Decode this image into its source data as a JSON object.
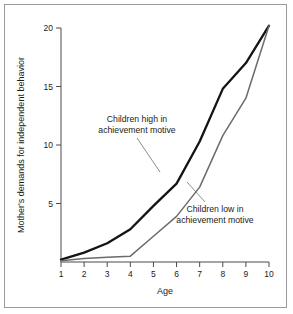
{
  "chart_data": {
    "type": "line",
    "title": "",
    "subtitle": "",
    "xlabel": "Age",
    "ylabel": "Mother's demands for independent behavior",
    "x": [
      1,
      2,
      3,
      4,
      5,
      6,
      7,
      8,
      9,
      10
    ],
    "xtick_labels": [
      "1",
      "2",
      "3",
      "4",
      "5",
      "6",
      "7",
      "8",
      "9",
      "10"
    ],
    "ytick_labels": [
      "5",
      "10",
      "15",
      "20"
    ],
    "yticks": [
      5,
      10,
      15,
      20
    ],
    "xlim": [
      1,
      10
    ],
    "ylim": [
      0,
      20.5
    ],
    "grid": false,
    "legend_position": "inline-annotations",
    "series": [
      {
        "name": "Children high in achievement motive",
        "color": "#141414",
        "line_width": "thick",
        "values": [
          0.2,
          0.8,
          1.6,
          2.8,
          4.8,
          6.7,
          10.3,
          14.8,
          17.0,
          20.2
        ]
      },
      {
        "name": "Children low in achievement motive",
        "color": "#6b6b6b",
        "line_width": "thin",
        "values": [
          0.1,
          0.3,
          0.4,
          0.5,
          2.2,
          3.9,
          6.4,
          10.8,
          14.0,
          20.2
        ]
      }
    ],
    "annotations": [
      {
        "id": "annotation-high",
        "lines": [
          "Children high in",
          "achievement motive"
        ],
        "text_x": 137,
        "text_y": 122,
        "anchor": "middle",
        "leader_from_x": 137,
        "leader_from_y": 138,
        "leader_to_x": 160,
        "leader_to_y": 172
      },
      {
        "id": "annotation-low",
        "lines": [
          "Children low in",
          "achievement motive"
        ],
        "text_x": 215,
        "text_y": 212,
        "anchor": "middle",
        "leader_from_x": 205,
        "leader_from_y": 202,
        "leader_to_x": 187,
        "leader_to_y": 182
      }
    ],
    "axes_geometry": {
      "x_pixel_at_age_1": 61,
      "x_pixel_at_age_10": 269,
      "y_pixel_at_0": 262,
      "y_pixel_at_20": 28
    }
  }
}
